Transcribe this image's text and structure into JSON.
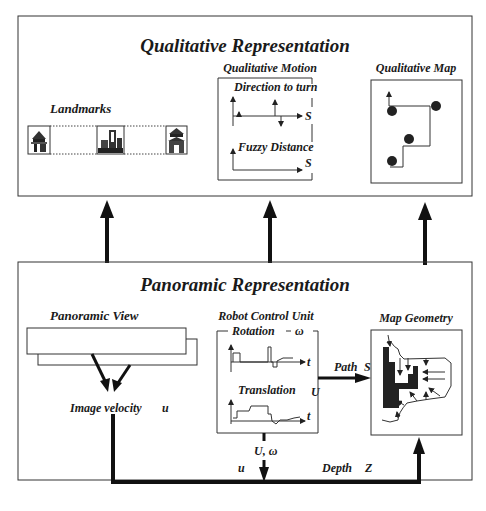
{
  "top_panel": {
    "title": "Qualitative Representation",
    "landmarks": {
      "label": "Landmarks",
      "icons": [
        "pagoda-landmark-icon",
        "city-buildings-landmark-icon",
        "temple-landmark-icon"
      ]
    },
    "qualitative_motion": {
      "title": "Qualitative Motion",
      "direction_label": "Direction to turn",
      "direction_axis": "S",
      "distance_label": "Fuzzy Distance",
      "distance_axis": "S"
    },
    "qualitative_map": {
      "title": "Qualitative Map"
    }
  },
  "bottom_panel": {
    "title": "Panoramic Representation",
    "panoramic_view": {
      "label": "Panoramic View"
    },
    "image_velocity": {
      "label": "Image velocity",
      "symbol": "u"
    },
    "robot_control_unit": {
      "title": "Robot Control Unit",
      "rotation_label": "Rotation",
      "rotation_symbol": "ω",
      "rotation_axis": "t",
      "translation_label": "Translation",
      "translation_symbol": "U",
      "translation_axis": "t",
      "output_label": "U, ω"
    },
    "path": {
      "label": "Path",
      "symbol": "S"
    },
    "map_geometry": {
      "title": "Map Geometry"
    },
    "flow": {
      "u_label": "u",
      "depth_label": "Depth",
      "depth_symbol": "Z"
    }
  },
  "colors": {
    "line": "#333333",
    "text": "#1a1a1a",
    "background": "#ffffff"
  }
}
